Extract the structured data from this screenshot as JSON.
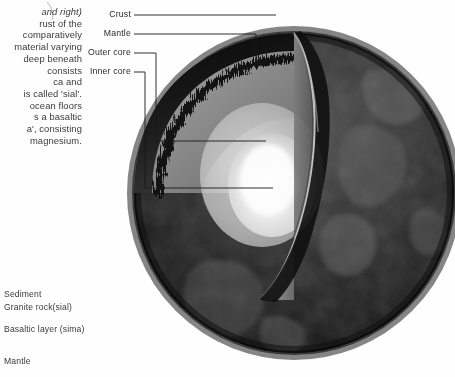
{
  "figure": {
    "background_color": "#ffffff",
    "globe": {
      "outer_color": "#262626",
      "mantle_color": "#8e8e8e",
      "outer_core_color": "#b9b9b9",
      "inner_core_color": "#f2f2f2",
      "crust_rim_color": "#111111"
    }
  },
  "caption": {
    "lines": [
      "and right)",
      "rust of the",
      "comparatively",
      "material varying",
      "deep beneath",
      "consists",
      "ca and",
      "is called 'sial'.",
      "ocean floors",
      "s a basaltic",
      "a', consisting",
      "magnesium."
    ],
    "italic_line_index": 0
  },
  "crust_labels": [
    {
      "label": "Sediment",
      "y": 289
    },
    {
      "label": "Granite rock(sial)",
      "y": 302
    },
    {
      "label": "Basaltic layer (sima)",
      "y": 324
    },
    {
      "label": "Mantle",
      "y": 356
    }
  ],
  "callouts": [
    {
      "label": "Crust",
      "x": 131,
      "y": 15
    },
    {
      "label": "Mantle",
      "x": 131,
      "y": 34
    },
    {
      "label": "Outer core",
      "x": 131,
      "y": 53
    },
    {
      "label": "Inner core",
      "x": 131,
      "y": 72
    }
  ],
  "leader_lines": {
    "color": "#1a1a1a",
    "width": 0.9,
    "paths": [
      "M134,15 L276,15",
      "M134,34 L256,34 L256,66",
      "M134,53 L156,53 L156,141 L266,141",
      "M134,72 L145,72 L145,188 L273,188"
    ]
  },
  "chart_data": {
    "type": "diagram",
    "layers": [
      {
        "name": "Crust",
        "description": "thin outer rocky shell"
      },
      {
        "name": "Mantle",
        "description": "thick silicate layer beneath the crust"
      },
      {
        "name": "Outer core",
        "description": "liquid metallic layer"
      },
      {
        "name": "Inner core",
        "description": "solid metallic centre"
      }
    ],
    "crust_detail": [
      "Sediment",
      "Granite rock(sial)",
      "Basaltic layer (sima)",
      "Mantle"
    ]
  }
}
